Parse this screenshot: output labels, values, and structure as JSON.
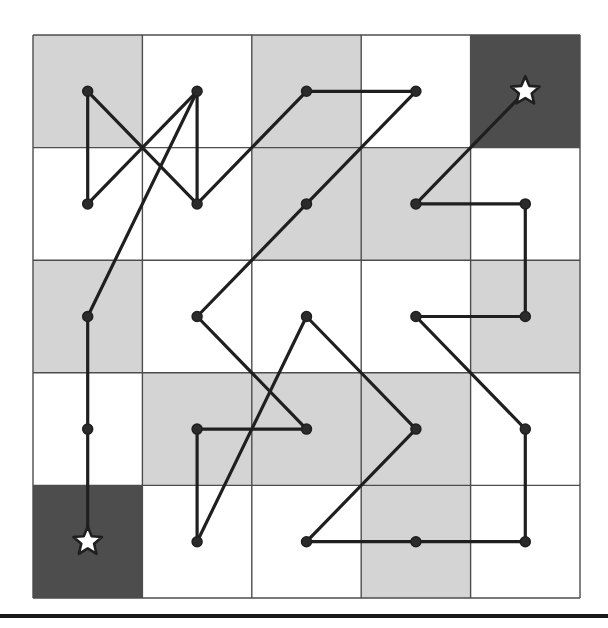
{
  "figure": {
    "title": "",
    "type": "grid-path-diagram"
  },
  "chart_data": {
    "type": "scatter",
    "title": "",
    "xlabel": "",
    "ylabel": "",
    "grid": true,
    "rows": 5,
    "cols": 5,
    "xlim": [
      0,
      5
    ],
    "ylim": [
      0,
      5
    ],
    "colors": {
      "light_cell": "#d4d4d4",
      "white_cell": "#ffffff",
      "dark_cell": "#4d4d4d",
      "grid_line": "#4d4d4d",
      "path_line": "#1f1f1f",
      "node_fill": "#2b2b2b",
      "star_fill": "#ffffff",
      "rule": "#1a1a1a"
    },
    "cell_shading": [
      [
        "light",
        "white",
        "light",
        "white",
        "dark"
      ],
      [
        "white",
        "white",
        "light",
        "light",
        "white"
      ],
      [
        "light",
        "white",
        "white",
        "white",
        "light"
      ],
      [
        "white",
        "light",
        "light",
        "light",
        "white"
      ],
      [
        "dark",
        "white",
        "white",
        "light",
        "white"
      ]
    ],
    "star_cells": [
      {
        "name": "goal-star",
        "col": 4,
        "row": 0
      },
      {
        "name": "start-star",
        "col": 0,
        "row": 4
      }
    ],
    "nodes": [
      {
        "id": "n0",
        "col": 0,
        "row": 0
      },
      {
        "id": "n1",
        "col": 1,
        "row": 0
      },
      {
        "id": "n2",
        "col": 2,
        "row": 0
      },
      {
        "id": "n3",
        "col": 3,
        "row": 0
      },
      {
        "id": "n4",
        "col": 0,
        "row": 1
      },
      {
        "id": "n5",
        "col": 1,
        "row": 1
      },
      {
        "id": "n6",
        "col": 2,
        "row": 1
      },
      {
        "id": "n7",
        "col": 3,
        "row": 1
      },
      {
        "id": "n8",
        "col": 4,
        "row": 1
      },
      {
        "id": "n9",
        "col": 0,
        "row": 2
      },
      {
        "id": "n10",
        "col": 1,
        "row": 2
      },
      {
        "id": "n11",
        "col": 2,
        "row": 2
      },
      {
        "id": "n12",
        "col": 3,
        "row": 2
      },
      {
        "id": "n13",
        "col": 4,
        "row": 2
      },
      {
        "id": "n14",
        "col": 0,
        "row": 3
      },
      {
        "id": "n15",
        "col": 1,
        "row": 3
      },
      {
        "id": "n16",
        "col": 2,
        "row": 3
      },
      {
        "id": "n17",
        "col": 3,
        "row": 3
      },
      {
        "id": "n18",
        "col": 4,
        "row": 3
      },
      {
        "id": "n19",
        "col": 1,
        "row": 4
      },
      {
        "id": "n20",
        "col": 2,
        "row": 4
      },
      {
        "id": "n21",
        "col": 3,
        "row": 4
      },
      {
        "id": "n22",
        "col": 4,
        "row": 4
      }
    ],
    "edges": [
      {
        "from": [
          0,
          0
        ],
        "to": [
          0,
          1
        ]
      },
      {
        "from": [
          0,
          0
        ],
        "to": [
          1,
          1
        ]
      },
      {
        "from": [
          0,
          1
        ],
        "to": [
          1,
          0
        ]
      },
      {
        "from": [
          1,
          0
        ],
        "to": [
          1,
          1
        ]
      },
      {
        "from": [
          1,
          1
        ],
        "to": [
          2,
          0
        ]
      },
      {
        "from": [
          2,
          0
        ],
        "to": [
          3,
          0
        ]
      },
      {
        "from": [
          3,
          0
        ],
        "to": [
          2,
          1
        ]
      },
      {
        "from": [
          2,
          1
        ],
        "to": [
          1,
          2
        ]
      },
      {
        "from": [
          1,
          0
        ],
        "to": [
          0,
          2
        ]
      },
      {
        "from": [
          0,
          2
        ],
        "to": [
          0,
          3
        ]
      },
      {
        "from": [
          0,
          3
        ],
        "to": [
          0,
          4
        ]
      },
      {
        "from": [
          1,
          2
        ],
        "to": [
          2,
          3
        ]
      },
      {
        "from": [
          2,
          3
        ],
        "to": [
          1,
          3
        ]
      },
      {
        "from": [
          1,
          3
        ],
        "to": [
          1,
          4
        ]
      },
      {
        "from": [
          1,
          4
        ],
        "to": [
          2,
          2
        ]
      },
      {
        "from": [
          2,
          2
        ],
        "to": [
          3,
          3
        ]
      },
      {
        "from": [
          3,
          3
        ],
        "to": [
          2,
          4
        ]
      },
      {
        "from": [
          2,
          4
        ],
        "to": [
          3,
          4
        ]
      },
      {
        "from": [
          3,
          4
        ],
        "to": [
          4,
          4
        ]
      },
      {
        "from": [
          4,
          4
        ],
        "to": [
          4,
          3
        ]
      },
      {
        "from": [
          4,
          3
        ],
        "to": [
          3,
          2
        ]
      },
      {
        "from": [
          3,
          2
        ],
        "to": [
          4,
          2
        ]
      },
      {
        "from": [
          4,
          2
        ],
        "to": [
          4,
          1
        ]
      },
      {
        "from": [
          4,
          1
        ],
        "to": [
          3,
          1
        ]
      },
      {
        "from": [
          3,
          1
        ],
        "to": [
          4,
          0
        ]
      }
    ],
    "geometry": {
      "grid_x0": 33,
      "grid_y0": 35,
      "cell_w": 109.4,
      "cell_h": 112.6,
      "node_radius": 5,
      "line_width": 3.2,
      "star_radius": 15
    },
    "bottom_rule_y": 614
  }
}
